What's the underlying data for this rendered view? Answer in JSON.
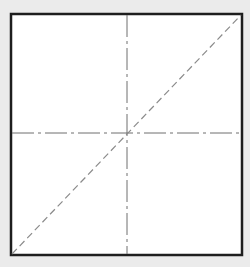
{
  "diagram": {
    "colors": {
      "background": "#ebebeb",
      "square_fill": "#ffffff",
      "square_stroke": "#1e1e1e",
      "centerline_stroke": "#6e6e6e",
      "diagonal_stroke": "#8a8a8a"
    },
    "square": {
      "x": 11,
      "y": 14,
      "width": 231,
      "height": 241,
      "stroke_width": 2.5
    },
    "vertical_centerline": {
      "x": 127,
      "y1": 15,
      "y2": 254,
      "style": "dash-dot"
    },
    "horizontal_centerline": {
      "y": 133,
      "x1": 12,
      "x2": 241,
      "style": "dash-dot"
    },
    "diagonal": {
      "x1": 12,
      "y1": 254,
      "x2": 241,
      "y2": 15,
      "style": "dashed"
    }
  }
}
